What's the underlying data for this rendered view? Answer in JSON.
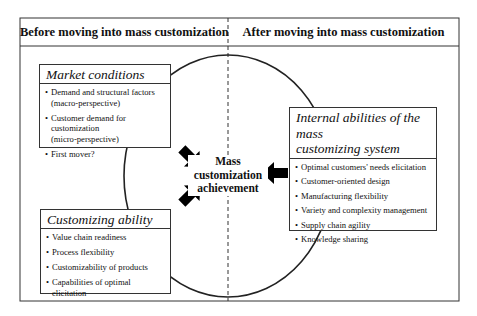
{
  "header": {
    "left_label": "Before moving into mass customization",
    "right_label": "After moving into mass customization"
  },
  "center": {
    "line1": "Mass",
    "line2": "customization",
    "line3": "achievement"
  },
  "market_conditions": {
    "title": "Market conditions",
    "items": [
      {
        "line1": "Demand  and structural factors",
        "line2": "(macro-perspective)"
      },
      {
        "line1": "Customer demand for customization",
        "line2": "(micro-perspective)"
      },
      {
        "line1": "First mover?",
        "line2": ""
      }
    ]
  },
  "customizing_ability": {
    "title": "Customizing ability",
    "items": [
      "Value chain readiness",
      "Process flexibility",
      "Customizability of products",
      "Capabilities of optimal elicitation"
    ]
  },
  "internal_abilities": {
    "title_line1": "Internal abilities of the mass",
    "title_line2": "customizing system",
    "items": [
      "Optimal customers' needs elicitation",
      "Customer-oriented design",
      "Manufacturing flexibility",
      "Variety and complexity management",
      "Supply chain agility",
      "Knowledge sharing"
    ]
  },
  "colors": {
    "line": "#333333",
    "arrow": "#000000",
    "background": "#ffffff"
  }
}
